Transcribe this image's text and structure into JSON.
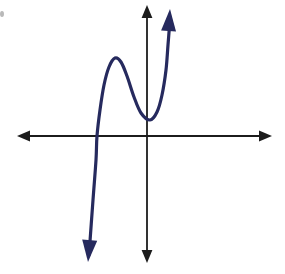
{
  "figure": {
    "width": 285,
    "height": 274,
    "background_color": "#ffffff"
  },
  "axes": {
    "color": "#1c1c1c",
    "stroke_width": 1.8,
    "origin": {
      "x": 147,
      "y": 136
    },
    "x_axis": {
      "name": "x-axis",
      "left_tip_x": 17,
      "right_tip_x": 272,
      "y": 136,
      "arrowheads": "both"
    },
    "y_axis": {
      "name": "y-axis",
      "top_tip_y": 5,
      "bottom_tip_y": 263,
      "x": 147,
      "arrowheads": "both"
    }
  },
  "chart_data": {
    "type": "line",
    "title": "",
    "xlabel": "",
    "ylabel": "",
    "grid": false,
    "legend": false,
    "curve_color": "#262a5e",
    "curve_stroke_width": 3.2,
    "features": {
      "x_intercept_left": {
        "x": 97,
        "y": 136
      },
      "local_maximum": {
        "x": 115,
        "y": 58
      },
      "local_minimum": {
        "x": 150,
        "y": 120
      },
      "start_arrow_tip": {
        "x": 88,
        "y": 262
      },
      "end_arrow_tip": {
        "x": 170,
        "y": 9
      }
    },
    "points": [
      {
        "x": 89,
        "y": 255
      },
      {
        "x": 93,
        "y": 200
      },
      {
        "x": 96,
        "y": 160
      },
      {
        "x": 97,
        "y": 136
      },
      {
        "x": 100,
        "y": 110
      },
      {
        "x": 104,
        "y": 85
      },
      {
        "x": 109,
        "y": 67
      },
      {
        "x": 115,
        "y": 58
      },
      {
        "x": 121,
        "y": 62
      },
      {
        "x": 127,
        "y": 76
      },
      {
        "x": 134,
        "y": 97
      },
      {
        "x": 141,
        "y": 113
      },
      {
        "x": 150,
        "y": 120
      },
      {
        "x": 157,
        "y": 112
      },
      {
        "x": 162,
        "y": 95
      },
      {
        "x": 166,
        "y": 70
      },
      {
        "x": 168,
        "y": 45
      },
      {
        "x": 170,
        "y": 20
      }
    ]
  },
  "artifacts": {
    "speck": {
      "x": 2,
      "y": 14,
      "color": "#b9b9b9"
    }
  }
}
